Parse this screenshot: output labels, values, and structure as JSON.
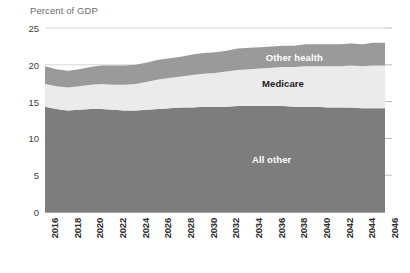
{
  "chart_data": {
    "type": "area",
    "title": "",
    "subtitle": "",
    "ylabel": "Percent of GDP",
    "xlabel": "",
    "ylim": [
      0,
      25
    ],
    "yticks": [
      0,
      5,
      10,
      15,
      20,
      25
    ],
    "grid": true,
    "legend_position": "inline-labels",
    "stacked": true,
    "x": [
      2016,
      2017,
      2018,
      2019,
      2020,
      2021,
      2022,
      2023,
      2024,
      2025,
      2026,
      2027,
      2028,
      2029,
      2030,
      2031,
      2032,
      2033,
      2034,
      2035,
      2036,
      2037,
      2038,
      2039,
      2040,
      2041,
      2042,
      2043,
      2044,
      2045,
      2046
    ],
    "tick_labels": [
      "2016",
      "2018",
      "2020",
      "2022",
      "2024",
      "2026",
      "2028",
      "2030",
      "2032",
      "2034",
      "2036",
      "2038",
      "2040",
      "2042",
      "2044",
      "2046"
    ],
    "series": [
      {
        "name": "All other",
        "color": "#7d7d7d",
        "label_color": "#ffffff",
        "values": [
          14.3,
          14.0,
          13.8,
          13.9,
          14.0,
          14.0,
          13.9,
          13.8,
          13.8,
          13.9,
          14.0,
          14.1,
          14.2,
          14.2,
          14.3,
          14.3,
          14.3,
          14.4,
          14.4,
          14.4,
          14.4,
          14.4,
          14.3,
          14.3,
          14.3,
          14.2,
          14.2,
          14.2,
          14.1,
          14.1,
          14.1
        ]
      },
      {
        "name": "Medicare",
        "color": "#ebebeb",
        "label_color": "#1a1a1a",
        "values": [
          3.1,
          3.1,
          3.1,
          3.2,
          3.3,
          3.4,
          3.4,
          3.5,
          3.6,
          3.8,
          4.0,
          4.1,
          4.2,
          4.4,
          4.5,
          4.6,
          4.8,
          4.9,
          5.0,
          5.1,
          5.2,
          5.3,
          5.4,
          5.5,
          5.5,
          5.6,
          5.6,
          5.7,
          5.7,
          5.8,
          5.8
        ]
      },
      {
        "name": "Other health",
        "color": "#9a9a9a",
        "label_color": "#ffffff",
        "values": [
          2.4,
          2.3,
          2.3,
          2.3,
          2.4,
          2.5,
          2.6,
          2.6,
          2.6,
          2.6,
          2.7,
          2.7,
          2.7,
          2.8,
          2.8,
          2.8,
          2.8,
          2.9,
          2.9,
          2.9,
          2.9,
          2.9,
          2.9,
          3.0,
          3.0,
          3.0,
          3.0,
          3.0,
          3.0,
          3.1,
          3.1
        ]
      }
    ],
    "totals": [
      19.8,
      19.4,
      19.2,
      19.4,
      19.7,
      19.9,
      19.9,
      19.9,
      20.0,
      20.3,
      20.7,
      20.9,
      21.1,
      21.4,
      21.6,
      21.7,
      21.9,
      22.2,
      22.3,
      22.4,
      22.5,
      22.6,
      22.6,
      22.8,
      22.8,
      22.8,
      22.8,
      22.9,
      22.8,
      23.0,
      23.0
    ],
    "band_labels": [
      {
        "text": "Other health",
        "x_year": 2038,
        "y_value": 21.0
      },
      {
        "text": "Medicare",
        "x_year": 2037,
        "y_value": 17.5
      },
      {
        "text": "All other",
        "x_year": 2036,
        "y_value": 7.2
      }
    ]
  }
}
